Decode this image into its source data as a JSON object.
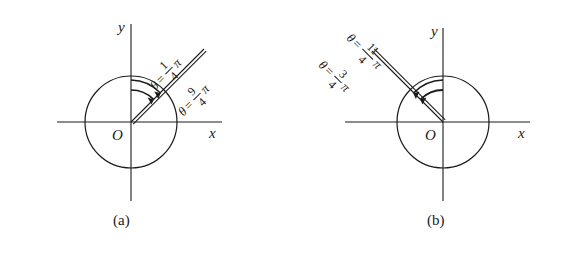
{
  "figure": {
    "background_color": "#ffffff",
    "stroke_color": "#1a1a1a",
    "panels": [
      {
        "id": "a",
        "caption": "(a)",
        "x_axis_label": "x",
        "y_axis_label": "y",
        "origin_label": "O",
        "ray_angle_degrees": 45,
        "circle_radius_px": 46,
        "labels": [
          {
            "name": "theta-quarter-pi",
            "theta_symbol": "θ",
            "equals": "=",
            "numerator": "1",
            "denominator": "4",
            "pi_symbol": "π",
            "value_text": "θ = 1/4 π"
          },
          {
            "name": "theta-nine-quarter-pi",
            "theta_symbol": "θ",
            "equals": "=",
            "numerator": "9",
            "denominator": "4",
            "pi_symbol": "π",
            "value_text": "θ = 9/4 π"
          }
        ]
      },
      {
        "id": "b",
        "caption": "(b)",
        "x_axis_label": "x",
        "y_axis_label": "y",
        "origin_label": "O",
        "ray_angle_degrees": 135,
        "circle_radius_px": 46,
        "labels": [
          {
            "name": "theta-eleven-quarter-pi",
            "theta_symbol": "θ",
            "equals": "=",
            "numerator": "11",
            "denominator": "4",
            "pi_symbol": "π",
            "value_text": "θ = 11/4 π"
          },
          {
            "name": "theta-three-quarter-pi",
            "theta_symbol": "θ",
            "equals": "=",
            "numerator": "3",
            "denominator": "4",
            "pi_symbol": "π",
            "value_text": "θ = 3/4 π"
          }
        ]
      }
    ]
  }
}
